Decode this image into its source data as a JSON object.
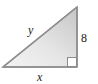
{
  "figure": {
    "kind": "right-triangle-diagram",
    "background_color": "#ffffff",
    "canvas": {
      "width": 98,
      "height": 84
    },
    "triangle": {
      "stroke_color": "#8c8c8c",
      "stroke_width": 1.5,
      "fill_light": "#f2f2f2",
      "fill_dark": "#c9c9c9",
      "vertices": {
        "left": {
          "x": 3,
          "y": 67
        },
        "bottom_right": {
          "x": 77,
          "y": 67
        },
        "top_right": {
          "x": 77,
          "y": 7
        }
      }
    },
    "right_angle_marker": {
      "present": true,
      "corner": "bottom-right",
      "size": 9,
      "fill_color": "#ffffff",
      "stroke_color": "#8c8c8c"
    },
    "labels": {
      "hypotenuse": {
        "text": "y",
        "style": "italic",
        "side": "hypotenuse"
      },
      "base": {
        "text": "x",
        "style": "italic",
        "side": "bottom"
      },
      "vertical": {
        "text": "8",
        "style": "upright",
        "side": "right"
      }
    }
  }
}
